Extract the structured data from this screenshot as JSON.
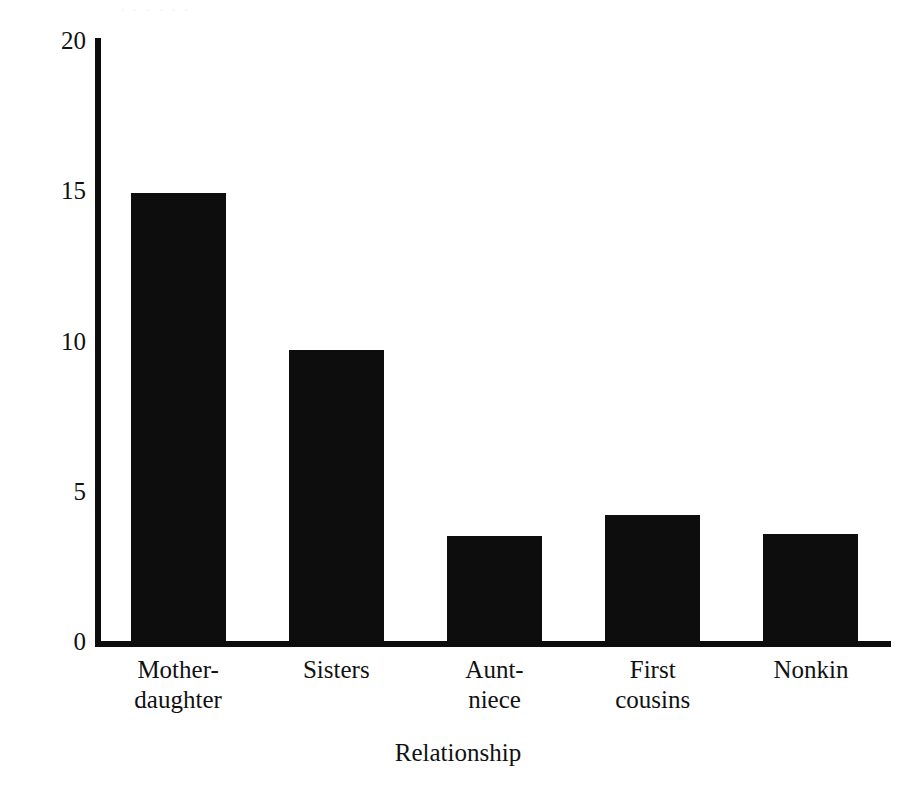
{
  "figure": {
    "background_color": "#ffffff",
    "ink_color": "#0d0d0d",
    "scan_artifact_text": "· · · · · ·"
  },
  "chart_data": {
    "type": "bar",
    "title": "",
    "xlabel": "Relationship",
    "ylabel": "Percent of  cooperative defenses",
    "categories": [
      "Mother-daughter",
      "Sisters",
      "Aunt-niece",
      "First cousins",
      "Nonkin"
    ],
    "category_lines": [
      [
        "Mother-",
        "daughter"
      ],
      [
        "Sisters",
        ""
      ],
      [
        "Aunt-",
        "niece"
      ],
      [
        "First",
        "cousins"
      ],
      [
        "Nonkin",
        ""
      ]
    ],
    "values": [
      14.9,
      9.7,
      3.5,
      4.2,
      3.55
    ],
    "ylim": [
      0,
      20
    ],
    "yticks": [
      0,
      5,
      10,
      15,
      20
    ],
    "ytick_labels": [
      "0",
      "5",
      "10",
      "15",
      "20"
    ],
    "grid": false,
    "legend": null,
    "bar_color": "#0d0d0d",
    "bar_width_px": 95,
    "series": [
      {
        "name": "Percent of cooperative defenses",
        "values": [
          14.9,
          9.7,
          3.5,
          4.2,
          3.55
        ]
      }
    ]
  }
}
